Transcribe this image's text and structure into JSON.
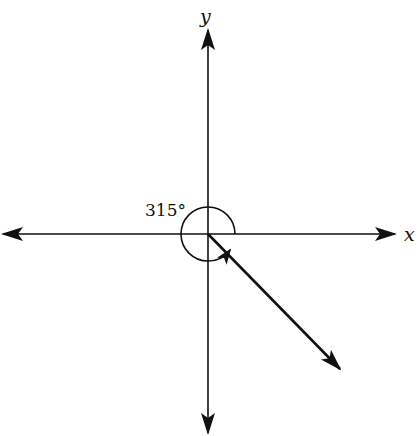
{
  "diagram": {
    "x_axis_label": "x",
    "y_axis_label": "y",
    "angle_label": "315°",
    "angle_degrees": 315,
    "origin": [
      208,
      234
    ],
    "terminal_side_end": [
      340,
      369
    ],
    "colors": {
      "stroke": "#111111",
      "background": "#ffffff"
    }
  }
}
